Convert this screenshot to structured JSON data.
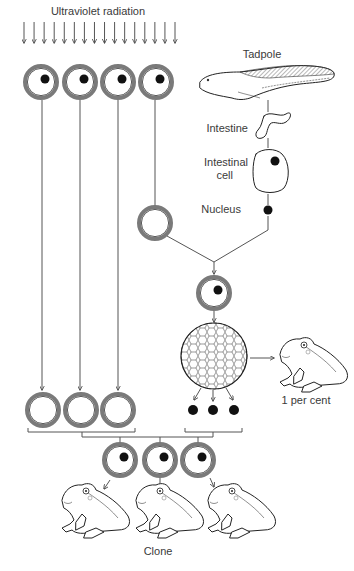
{
  "labels": {
    "uv": "Ultraviolet radiation",
    "tadpole": "Tadpole",
    "intestine": "Intestine",
    "intestinal_cell_1": "Intestinal",
    "intestinal_cell_2": "cell",
    "nucleus": "Nucleus",
    "success_rate": "1 per cent",
    "clone": "Clone"
  },
  "colors": {
    "cell_membrane": "#7a7a7a",
    "nucleus": "#111111",
    "line": "#555555",
    "text": "#3a3a3a"
  },
  "uv_arrows": {
    "count": 16,
    "x_start": 24,
    "x_end": 175,
    "y_top": 22,
    "y_bottom": 43
  },
  "egg_cells_top": [
    {
      "x": 41,
      "y": 82,
      "nucleus": true
    },
    {
      "x": 80,
      "y": 82,
      "nucleus": true
    },
    {
      "x": 118,
      "y": 82,
      "nucleus": true
    },
    {
      "x": 156,
      "y": 82,
      "nucleus": true
    }
  ],
  "enucleated_cell": {
    "x": 155,
    "y": 223
  },
  "combined_cell": {
    "x": 214,
    "y": 293
  },
  "blastula": {
    "x": 214,
    "y": 356,
    "r": 33
  },
  "blastula_nuclei": [
    {
      "x": 193,
      "y": 410
    },
    {
      "x": 213,
      "y": 410
    },
    {
      "x": 234,
      "y": 410
    }
  ],
  "enucleated_cells_bottom": [
    {
      "x": 43,
      "y": 410
    },
    {
      "x": 81,
      "y": 410
    },
    {
      "x": 118,
      "y": 410
    }
  ],
  "clone_cells": [
    {
      "x": 120,
      "y": 460
    },
    {
      "x": 160,
      "y": 460
    },
    {
      "x": 198,
      "y": 460
    }
  ],
  "clone_frogs": [
    {
      "x": 60,
      "y": 490
    },
    {
      "x": 134,
      "y": 490
    },
    {
      "x": 208,
      "y": 490
    }
  ],
  "adult_frog": {
    "x": 258,
    "y": 340
  }
}
